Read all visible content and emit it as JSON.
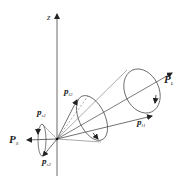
{
  "diagram": {
    "title": "",
    "axis": {
      "label": "z"
    },
    "vectors": {
      "P_L": {
        "main": "P",
        "sub": "L"
      },
      "P_S": {
        "main": "P",
        "sub": "S"
      },
      "p_l1": {
        "main": "p",
        "sub": "l1"
      },
      "p_l2": {
        "main": "p",
        "sub": "l2"
      },
      "p_s1": {
        "main": "p",
        "sub": "s1"
      },
      "p_s2": {
        "main": "p",
        "sub": "s2"
      }
    },
    "colors": {
      "line": "#333333",
      "background": "#ffffff"
    }
  }
}
